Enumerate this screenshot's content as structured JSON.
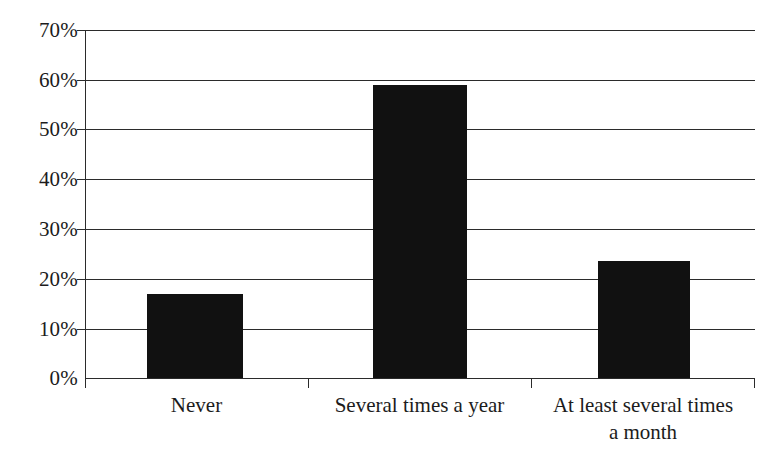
{
  "chart_data": {
    "type": "bar",
    "title": "",
    "subtitle": "",
    "xlabel": "",
    "ylabel": "",
    "categories": [
      "Never",
      "Several times a year",
      "At least several times a month"
    ],
    "values": [
      17.0,
      59.0,
      23.5
    ],
    "ylim": [
      0,
      70
    ],
    "ytick_values": [
      0,
      10,
      20,
      30,
      40,
      50,
      60,
      70
    ],
    "ytick_labels": [
      "0%",
      "10%",
      "20%",
      "30%",
      "40%",
      "50%",
      "60%",
      "70%"
    ],
    "grid": "horizontal",
    "legend": "none",
    "bar_color": "#111111",
    "axis_color": "#2b2b2b",
    "background_color": "#ffffff"
  },
  "axes": {
    "y": {
      "ticks": [
        {
          "label": "70%",
          "value": 70
        },
        {
          "label": "60%",
          "value": 60
        },
        {
          "label": "50%",
          "value": 50
        },
        {
          "label": "40%",
          "value": 40
        },
        {
          "label": "30%",
          "value": 30
        },
        {
          "label": "20%",
          "value": 20
        },
        {
          "label": "10%",
          "value": 10
        },
        {
          "label": "0%",
          "value": 0
        }
      ]
    },
    "x": {
      "categories": [
        {
          "label": "Never",
          "line1": "Never",
          "line2": ""
        },
        {
          "label": "Several times a year",
          "line1": "Several times a year",
          "line2": ""
        },
        {
          "label": "At least several times a month",
          "line1": "At least several times",
          "line2": "a month"
        }
      ]
    }
  },
  "bars": [
    {
      "name": "never",
      "value": 17.0
    },
    {
      "name": "several-times-a-year",
      "value": 59.0
    },
    {
      "name": "at-least-several-times-a-month",
      "value": 23.5
    }
  ]
}
